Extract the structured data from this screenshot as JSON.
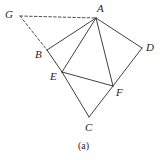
{
  "figure": {
    "caption": "(a)",
    "caption_position": {
      "x": 78,
      "y": 141
    },
    "canvas": {
      "width": 165,
      "height": 160
    },
    "colors": {
      "background": "#ffffff",
      "solid_edge": "#2b2b2b",
      "dashed_edge": "#3a3a3a",
      "label_text": "#1e1e1e"
    },
    "vertices": [
      {
        "id": "G",
        "label": "G",
        "x": 20,
        "y": 16,
        "label_x": 5,
        "label_y": 9
      },
      {
        "id": "A",
        "label": "A",
        "x": 96,
        "y": 18,
        "label_x": 97,
        "label_y": 3
      },
      {
        "id": "B",
        "label": "B",
        "x": 47,
        "y": 50,
        "label_x": 35,
        "label_y": 49
      },
      {
        "id": "D",
        "label": "D",
        "x": 142,
        "y": 48,
        "label_x": 146,
        "label_y": 42
      },
      {
        "id": "E",
        "label": "E",
        "x": 62,
        "y": 72,
        "label_x": 50,
        "label_y": 71
      },
      {
        "id": "F",
        "label": "F",
        "x": 113,
        "y": 86,
        "label_x": 116,
        "label_y": 87
      },
      {
        "id": "C",
        "label": "C",
        "x": 89,
        "y": 117,
        "label_x": 85,
        "label_y": 122
      }
    ],
    "edges": [
      {
        "id": "A-B",
        "from": "A",
        "to": "B",
        "style": "solid"
      },
      {
        "id": "A-E",
        "from": "A",
        "to": "E",
        "style": "solid"
      },
      {
        "id": "A-F",
        "from": "A",
        "to": "F",
        "style": "solid"
      },
      {
        "id": "A-D",
        "from": "A",
        "to": "D",
        "style": "solid"
      },
      {
        "id": "B-E",
        "from": "B",
        "to": "E",
        "style": "solid"
      },
      {
        "id": "E-F",
        "from": "E",
        "to": "F",
        "style": "solid"
      },
      {
        "id": "E-C",
        "from": "E",
        "to": "C",
        "style": "solid"
      },
      {
        "id": "D-F",
        "from": "D",
        "to": "F",
        "style": "solid"
      },
      {
        "id": "F-C",
        "from": "F",
        "to": "C",
        "style": "solid"
      },
      {
        "id": "G-A",
        "from": "G",
        "to": "A",
        "style": "dashed"
      },
      {
        "id": "G-B",
        "from": "G",
        "to": "B",
        "style": "dashed"
      }
    ]
  }
}
